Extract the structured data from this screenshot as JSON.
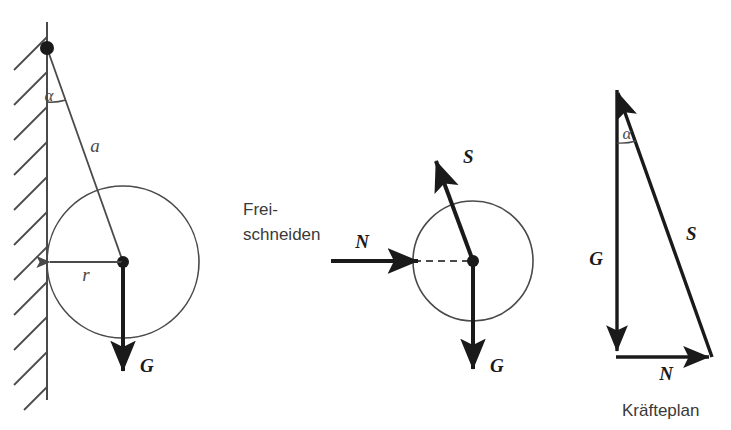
{
  "figure": {
    "background_color": "#ffffff",
    "line_color": "#4a4a4a",
    "bold_line_color": "#1a1a1a"
  },
  "left_diagram": {
    "name": "system-sketch",
    "labels": {
      "angle": "α",
      "rope_length": "a",
      "radius": "r",
      "weight": "G"
    }
  },
  "center_text": {
    "line1": "Frei-",
    "line2": "schneiden"
  },
  "middle_diagram": {
    "name": "free-body-diagram",
    "labels": {
      "rope_force": "S",
      "normal_force": "N",
      "weight": "G"
    }
  },
  "right_diagram": {
    "name": "force-triangle",
    "labels": {
      "angle": "α",
      "weight": "G",
      "rope_force": "S",
      "normal_force": "N"
    },
    "caption": "Kräfteplan"
  }
}
